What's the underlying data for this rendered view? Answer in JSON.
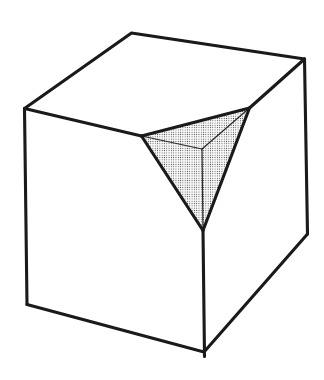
{
  "figure": {
    "canvas": {
      "width": 324,
      "height": 380
    },
    "colors": {
      "background": "#ffffff",
      "line": "#1a1a1a",
      "thin_line": "#2a2a2a",
      "stipple_dot": "#3a3a3a",
      "face_fill": "#ffffff",
      "stipple_base": "#fbfbfb"
    },
    "stroke": {
      "thick_width": 3.1,
      "thin_width": 1.2
    },
    "stipple": {
      "tile": 2.3,
      "dot_radius": 0.52
    },
    "vertices": {
      "top_back": [
        131.5,
        33
      ],
      "top_left": [
        24.5,
        108.5
      ],
      "top_right": [
        304.5,
        59
      ],
      "bottom_left": [
        27,
        304.5
      ],
      "bottom_front": [
        204,
        352
      ],
      "bottom_right": [
        307.5,
        234
      ],
      "notch_top_left": [
        141.5,
        136
      ],
      "notch_top_right": [
        249.5,
        108
      ],
      "notch_bottom": [
        203,
        230.5
      ],
      "notch_apex": [
        202,
        149
      ],
      "front_edge_end": [
        204.5,
        356.5
      ]
    },
    "faces": [
      {
        "name": "cube-top-face",
        "fill": "face",
        "points": [
          "top_left",
          "top_back",
          "top_right",
          "notch_top_right",
          "notch_top_left"
        ]
      },
      {
        "name": "cube-left-face",
        "fill": "face",
        "points": [
          "top_left",
          "notch_top_left",
          "notch_bottom",
          "bottom_front",
          "bottom_left"
        ]
      },
      {
        "name": "cube-right-face",
        "fill": "face",
        "points": [
          "top_right",
          "bottom_right",
          "bottom_front",
          "notch_bottom",
          "notch_top_right"
        ]
      },
      {
        "name": "notch-stippled-face",
        "fill": "stipple",
        "points": [
          "notch_top_left",
          "notch_top_right",
          "notch_bottom"
        ]
      }
    ],
    "thin_edges": [
      {
        "name": "notch-inner-edge-left",
        "points": [
          "notch_apex",
          "notch_top_left"
        ]
      },
      {
        "name": "notch-inner-edge-right",
        "points": [
          "notch_apex",
          "notch_top_right"
        ]
      },
      {
        "name": "notch-inner-edge-bottom",
        "points": [
          "notch_apex",
          "notch_bottom"
        ]
      }
    ],
    "thick_edges": [
      {
        "name": "cube-top-outline-edge",
        "points": [
          "top_left",
          "top_back",
          "top_right"
        ]
      },
      {
        "name": "cube-right-vertical-edge",
        "points": [
          "top_right",
          "bottom_right"
        ]
      },
      {
        "name": "cube-bottom-right-edge",
        "points": [
          "bottom_right",
          "bottom_front"
        ]
      },
      {
        "name": "cube-bottom-left-edge",
        "points": [
          "bottom_front",
          "bottom_left"
        ]
      },
      {
        "name": "cube-left-vertical-edge",
        "points": [
          "bottom_left",
          "top_left"
        ]
      },
      {
        "name": "cube-top-front-left-edge",
        "points": [
          "top_left",
          "notch_top_left"
        ]
      },
      {
        "name": "cube-top-front-right-edge",
        "points": [
          "top_right",
          "notch_top_right"
        ]
      },
      {
        "name": "notch-top-edge",
        "points": [
          "notch_top_left",
          "notch_top_right"
        ]
      },
      {
        "name": "notch-left-edge",
        "points": [
          "notch_top_left",
          "notch_bottom"
        ]
      },
      {
        "name": "notch-right-edge",
        "points": [
          "notch_top_right",
          "notch_bottom"
        ]
      },
      {
        "name": "cube-front-vertical-edge",
        "points": [
          "notch_bottom",
          "front_edge_end"
        ]
      }
    ]
  }
}
